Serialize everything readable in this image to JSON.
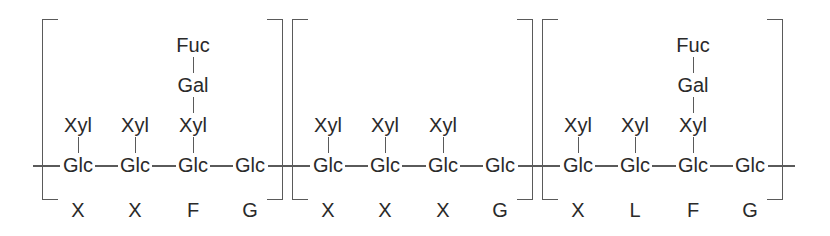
{
  "diagram": {
    "blocks": [
      {
        "code": [
          "X",
          "X",
          "F",
          "G"
        ],
        "backbone": [
          "Glc",
          "Glc",
          "Glc",
          "Glc"
        ],
        "sidechains": [
          [
            "Xyl"
          ],
          [
            "Xyl"
          ],
          [
            "Xyl",
            "Gal",
            "Fuc"
          ],
          []
        ]
      },
      {
        "code": [
          "X",
          "X",
          "X",
          "G"
        ],
        "backbone": [
          "Glc",
          "Glc",
          "Glc",
          "Glc"
        ],
        "sidechains": [
          [
            "Xyl"
          ],
          [
            "Xyl"
          ],
          [
            "Xyl"
          ],
          []
        ]
      },
      {
        "code": [
          "X",
          "L",
          "F",
          "G"
        ],
        "backbone": [
          "Glc",
          "Glc",
          "Glc",
          "Glc"
        ],
        "sidechains": [
          [
            "Xyl"
          ],
          [
            "Xyl"
          ],
          [
            "Xyl",
            "Gal",
            "Fuc"
          ],
          []
        ]
      }
    ]
  }
}
